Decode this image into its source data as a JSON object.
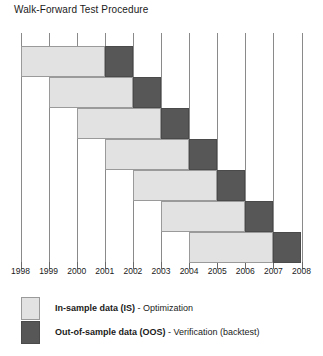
{
  "chart_data": {
    "type": "bar",
    "title": "Walk-Forward Test Procedure",
    "xlabel": "",
    "ylabel": "",
    "orientation": "horizontal",
    "grid": true,
    "legend_position": "bottom-left",
    "xlim": [
      1998,
      2008
    ],
    "tick_labels": [
      "1998",
      "1999",
      "2000",
      "2001",
      "2002",
      "2003",
      "2004",
      "2005",
      "2006",
      "2007",
      "2008"
    ],
    "series": [
      {
        "name": "In-sample data (IS)",
        "color": "#e2e2e2"
      },
      {
        "name": "Out-of-sample data (OOS)",
        "color": "#575757"
      }
    ],
    "runs": [
      {
        "in_sample_start": 1998,
        "in_sample_end": 2001,
        "out_of_sample_start": 2001,
        "out_of_sample_end": 2002
      },
      {
        "in_sample_start": 1999,
        "in_sample_end": 2002,
        "out_of_sample_start": 2002,
        "out_of_sample_end": 2003
      },
      {
        "in_sample_start": 2000,
        "in_sample_end": 2003,
        "out_of_sample_start": 2003,
        "out_of_sample_end": 2004
      },
      {
        "in_sample_start": 2001,
        "in_sample_end": 2004,
        "out_of_sample_start": 2004,
        "out_of_sample_end": 2005
      },
      {
        "in_sample_start": 2002,
        "in_sample_end": 2005,
        "out_of_sample_start": 2005,
        "out_of_sample_end": 2006
      },
      {
        "in_sample_start": 2003,
        "in_sample_end": 2006,
        "out_of_sample_start": 2006,
        "out_of_sample_end": 2007
      },
      {
        "in_sample_start": 2004,
        "in_sample_end": 2007,
        "out_of_sample_start": 2007,
        "out_of_sample_end": 2008
      }
    ]
  },
  "title": "Walk-Forward Test Procedure",
  "legend": [
    {
      "key": "is",
      "bold_label": "In-sample data (IS)",
      "rest_label": " - Optimization"
    },
    {
      "key": "oos",
      "bold_label": "Out-of-sample data (OOS)",
      "rest_label": " - Verification (backtest)"
    }
  ]
}
